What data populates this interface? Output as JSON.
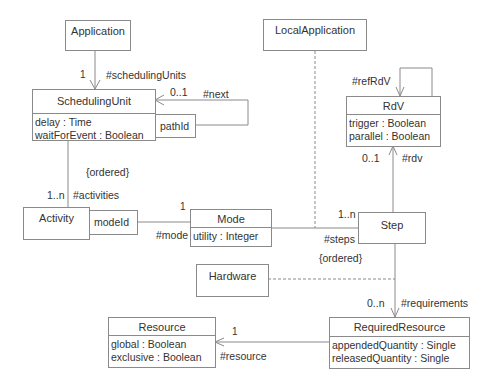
{
  "classes": {
    "application": {
      "name": "Application"
    },
    "local_application": {
      "name": "LocalApplication"
    },
    "scheduling_unit": {
      "name": "SchedulingUnit",
      "attributes": [
        "delay : Time",
        "waitForEvent : Boolean"
      ],
      "qualifier": "pathId"
    },
    "rdv": {
      "name": "RdV",
      "attributes": [
        "trigger : Boolean",
        "parallel : Boolean"
      ]
    },
    "activity": {
      "name": "Activity",
      "qualifier": "modeId"
    },
    "mode": {
      "name": "Mode",
      "attributes": [
        "utility : Integer"
      ]
    },
    "step": {
      "name": "Step"
    },
    "hardware": {
      "name": "Hardware"
    },
    "resource": {
      "name": "Resource",
      "attributes": [
        "global : Boolean",
        "exclusive : Boolean"
      ]
    },
    "required_resource": {
      "name": "RequiredResource",
      "attributes": [
        "appendedQuantity : Single",
        "releasedQuantity : Single"
      ]
    }
  },
  "labels": {
    "app_su_mult": "1",
    "app_su_role": "#schedulingUnits",
    "su_next_mult": "0..1",
    "su_next_role": "#next",
    "su_act_constraint": "{ordered}",
    "su_act_mult": "1..n",
    "su_act_role": "#activities",
    "act_mode_mult": "1",
    "act_mode_role": "#mode",
    "rdv_ref_role": "#refRdV",
    "rdv_mult": "0..1",
    "rdv_role": "#rdv",
    "steps_mult": "1..n",
    "steps_role": "#steps",
    "steps_constraint": "{ordered}",
    "req_mult": "0..n",
    "req_role": "#requirements",
    "res_mult": "1",
    "res_role": "#resource"
  },
  "colors": {
    "line": "#8a8a8a",
    "text": "#333333",
    "background": "#ffffff"
  }
}
